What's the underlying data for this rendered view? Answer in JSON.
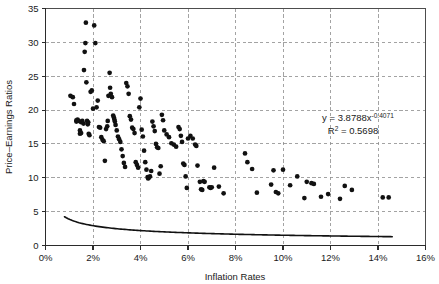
{
  "chart_data": {
    "type": "scatter",
    "title": "",
    "xlabel": "Inflation Rates",
    "ylabel": "Price–Earnings Ratios",
    "xlim": [
      0,
      16
    ],
    "ylim": [
      0,
      35
    ],
    "xticks": [
      0,
      2,
      4,
      6,
      8,
      10,
      12,
      14,
      16
    ],
    "yticks": [
      0,
      5,
      10,
      15,
      20,
      25,
      30,
      35
    ],
    "xtick_labels": [
      "0%",
      "2%",
      "4%",
      "6%",
      "8%",
      "10%",
      "12%",
      "14%",
      "16%"
    ],
    "ytick_labels": [
      "0",
      "5",
      "10",
      "15",
      "20",
      "25",
      "30",
      "35"
    ],
    "grid": true,
    "legend": false,
    "annotations": {
      "equation": "y = 3.8788x",
      "equation_exponent": "-0.4071",
      "r_squared_label": "R",
      "r_squared_sup": "2",
      "r_squared_value": " = 0.5698"
    },
    "trendline": {
      "type": "power",
      "coefficient": 3.8788,
      "exponent": -0.4071,
      "r_squared": 0.5698,
      "x_start": 0.8,
      "x_end": 14.6
    },
    "points": [
      [
        1.05,
        22.1
      ],
      [
        1.15,
        21.9
      ],
      [
        1.2,
        20.9
      ],
      [
        1.3,
        18.5
      ],
      [
        1.3,
        18.3
      ],
      [
        1.35,
        18.6
      ],
      [
        1.4,
        18.4
      ],
      [
        1.45,
        17.0
      ],
      [
        1.45,
        16.5
      ],
      [
        1.5,
        16.6
      ],
      [
        1.5,
        18.2
      ],
      [
        1.55,
        18.4
      ],
      [
        1.6,
        18.0
      ],
      [
        1.62,
        25.9
      ],
      [
        1.65,
        28.6
      ],
      [
        1.68,
        29.9
      ],
      [
        1.7,
        32.9
      ],
      [
        1.72,
        24.1
      ],
      [
        1.75,
        18.4
      ],
      [
        1.78,
        17.9
      ],
      [
        1.8,
        18.2
      ],
      [
        1.82,
        16.5
      ],
      [
        1.85,
        16.3
      ],
      [
        1.9,
        22.7
      ],
      [
        1.95,
        22.9
      ],
      [
        2.0,
        20.2
      ],
      [
        2.05,
        32.5
      ],
      [
        2.1,
        29.9
      ],
      [
        2.15,
        20.4
      ],
      [
        2.2,
        21.4
      ],
      [
        2.25,
        17.5
      ],
      [
        2.3,
        17.4
      ],
      [
        2.35,
        16.0
      ],
      [
        2.4,
        15.6
      ],
      [
        2.45,
        15.4
      ],
      [
        2.5,
        12.5
      ],
      [
        2.55,
        17.2
      ],
      [
        2.6,
        17.6
      ],
      [
        2.62,
        18.4
      ],
      [
        2.65,
        22.1
      ],
      [
        2.7,
        25.5
      ],
      [
        2.72,
        23.3
      ],
      [
        2.75,
        22.4
      ],
      [
        2.8,
        21.9
      ],
      [
        2.85,
        19.2
      ],
      [
        2.88,
        18.9
      ],
      [
        2.9,
        18.6
      ],
      [
        2.92,
        18.3
      ],
      [
        2.95,
        17.8
      ],
      [
        3.0,
        17.0
      ],
      [
        3.05,
        16.1
      ],
      [
        3.1,
        15.7
      ],
      [
        3.15,
        15.3
      ],
      [
        3.2,
        14.2
      ],
      [
        3.25,
        13.2
      ],
      [
        3.3,
        12.2
      ],
      [
        3.35,
        11.6
      ],
      [
        3.4,
        24.0
      ],
      [
        3.45,
        23.5
      ],
      [
        3.5,
        22.4
      ],
      [
        3.55,
        19.1
      ],
      [
        3.6,
        18.6
      ],
      [
        3.65,
        17.4
      ],
      [
        3.7,
        17.2
      ],
      [
        3.75,
        16.6
      ],
      [
        3.8,
        12.3
      ],
      [
        3.85,
        11.9
      ],
      [
        3.9,
        11.5
      ],
      [
        3.95,
        20.4
      ],
      [
        4.0,
        21.7
      ],
      [
        4.05,
        17.1
      ],
      [
        4.1,
        16.1
      ],
      [
        4.15,
        14.0
      ],
      [
        4.2,
        12.3
      ],
      [
        4.25,
        11.2
      ],
      [
        4.3,
        10.1
      ],
      [
        4.32,
        9.9
      ],
      [
        4.35,
        10.0
      ],
      [
        4.4,
        10.2
      ],
      [
        4.45,
        11.0
      ],
      [
        4.5,
        18.3
      ],
      [
        4.55,
        17.6
      ],
      [
        4.6,
        16.9
      ],
      [
        4.65,
        15.0
      ],
      [
        4.7,
        14.5
      ],
      [
        4.75,
        14.4
      ],
      [
        4.8,
        10.6
      ],
      [
        4.85,
        11.7
      ],
      [
        4.9,
        19.3
      ],
      [
        4.95,
        18.5
      ],
      [
        5.0,
        17.0
      ],
      [
        5.1,
        16.4
      ],
      [
        5.2,
        16.0
      ],
      [
        5.3,
        15.1
      ],
      [
        5.4,
        14.9
      ],
      [
        5.5,
        14.6
      ],
      [
        5.6,
        17.5
      ],
      [
        5.65,
        17.2
      ],
      [
        5.7,
        16.2
      ],
      [
        5.75,
        15.3
      ],
      [
        5.8,
        12.1
      ],
      [
        5.85,
        11.9
      ],
      [
        5.9,
        10.2
      ],
      [
        5.95,
        8.5
      ],
      [
        6.0,
        15.8
      ],
      [
        6.1,
        16.2
      ],
      [
        6.2,
        15.8
      ],
      [
        6.3,
        14.9
      ],
      [
        6.35,
        14.7
      ],
      [
        6.4,
        11.8
      ],
      [
        6.5,
        9.4
      ],
      [
        6.55,
        8.3
      ],
      [
        6.6,
        8.2
      ],
      [
        6.65,
        9.5
      ],
      [
        6.7,
        9.4
      ],
      [
        6.9,
        8.6
      ],
      [
        6.95,
        8.5
      ],
      [
        7.0,
        8.6
      ],
      [
        7.1,
        11.5
      ],
      [
        7.3,
        8.7
      ],
      [
        7.5,
        7.7
      ],
      [
        8.4,
        13.6
      ],
      [
        8.5,
        12.3
      ],
      [
        8.7,
        11.3
      ],
      [
        8.9,
        7.8
      ],
      [
        9.5,
        9.0
      ],
      [
        9.6,
        11.1
      ],
      [
        9.7,
        7.9
      ],
      [
        9.8,
        7.7
      ],
      [
        10.0,
        11.2
      ],
      [
        10.3,
        8.9
      ],
      [
        10.6,
        10.2
      ],
      [
        10.9,
        7.0
      ],
      [
        11.0,
        9.4
      ],
      [
        11.2,
        9.2
      ],
      [
        11.3,
        9.1
      ],
      [
        11.6,
        7.2
      ],
      [
        11.9,
        7.6
      ],
      [
        12.4,
        6.9
      ],
      [
        12.6,
        8.8
      ],
      [
        12.9,
        8.2
      ],
      [
        14.2,
        7.1
      ],
      [
        14.45,
        7.1
      ]
    ]
  }
}
